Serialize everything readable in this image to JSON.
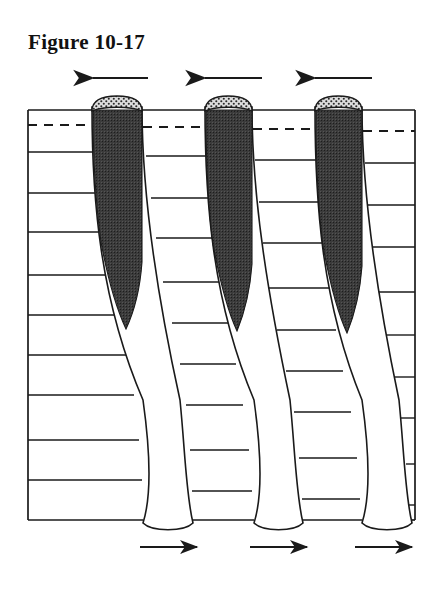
{
  "figure": {
    "caption": "Figure 10-17",
    "kind": "geological-cross-section-diagram"
  },
  "canvas": {
    "width": 440,
    "height": 590,
    "background": "#ffffff"
  },
  "colors": {
    "line": "#1a1a1a",
    "fill_dark_wedge": "#3a3a3a",
    "fill_stipple_cap": "#d8d8d8",
    "stipple_dot": "#2b2b2b",
    "strata_fill": "#ffffff",
    "channel_fill": "#ffffff",
    "text": "#111111"
  },
  "box": {
    "left": 28,
    "right": 415,
    "top": 110,
    "bottom": 520,
    "stroke_width": 1.6
  },
  "dashed_line": {
    "label": "marker-horizon",
    "y": 125,
    "dash": "9 7",
    "stroke_width": 2.0
  },
  "strata": {
    "label": "layered-strata",
    "count": 11,
    "baseline_y": [
      152,
      193,
      232,
      275,
      315,
      355,
      395,
      440,
      480
    ],
    "stroke_width": 1.4
  },
  "channels": [
    {
      "name": "channel-1",
      "top_left_x": 92,
      "top_right_x": 142,
      "bottom_left_x": 143,
      "bottom_right_x": 193,
      "cap": {
        "cx": 117,
        "cy": 107,
        "rx": 25,
        "ry": 7
      },
      "wedge_tip_y": 330
    },
    {
      "name": "channel-2",
      "top_left_x": 205,
      "top_right_x": 252,
      "bottom_left_x": 254,
      "bottom_right_x": 303,
      "cap": {
        "cx": 228,
        "cy": 107,
        "rx": 24,
        "ry": 7
      },
      "wedge_tip_y": 330
    },
    {
      "name": "channel-3",
      "top_left_x": 315,
      "top_right_x": 362,
      "bottom_left_x": 362,
      "bottom_right_x": 412,
      "cap": {
        "cx": 338,
        "cy": 107,
        "rx": 24,
        "ry": 7
      },
      "wedge_tip_y": 330
    }
  ],
  "arrows_top": {
    "label": "shear-direction-top",
    "direction": "left",
    "y": 78,
    "items": [
      {
        "name": "top-arrow-1",
        "x_start": 148,
        "x_end": 90
      },
      {
        "name": "top-arrow-2",
        "x_start": 262,
        "x_end": 202
      },
      {
        "name": "top-arrow-3",
        "x_start": 372,
        "x_end": 312
      }
    ]
  },
  "arrows_bottom": {
    "label": "shear-direction-bottom",
    "direction": "right",
    "y": 547,
    "items": [
      {
        "name": "bottom-arrow-1",
        "x_start": 140,
        "x_end": 200
      },
      {
        "name": "bottom-arrow-2",
        "x_start": 250,
        "x_end": 310
      },
      {
        "name": "bottom-arrow-3",
        "x_start": 355,
        "x_end": 415
      }
    ]
  }
}
